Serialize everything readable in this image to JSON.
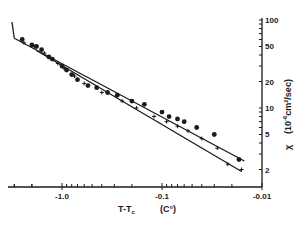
{
  "chart_data": {
    "type": "scatter",
    "title": "",
    "xlabel": "T-T_c   (C°)",
    "ylabel": "χ (10^-6 cm²/sec)",
    "x_scale": "log (negative values, magnitude decreasing to the right)",
    "y_scale": "log",
    "xlim": [
      -3.0,
      -0.01
    ],
    "ylim": [
      1.5,
      100
    ],
    "x_ticks_labeled": [
      "-1.0",
      "-0.1",
      "-0.01"
    ],
    "y_ticks_labeled": [
      "100",
      "50",
      "20",
      "10",
      "5",
      "2"
    ],
    "y_axis_position": "right",
    "grid": false,
    "legend": null,
    "series": [
      {
        "name": "filled circles",
        "marker": "circle",
        "x": [
          -2.5,
          -2.0,
          -1.8,
          -1.6,
          -1.35,
          -1.25,
          -1.0,
          -0.9,
          -0.8,
          -0.7,
          -0.55,
          -0.45,
          -0.35,
          -0.28,
          -0.2,
          -0.15,
          -0.1,
          -0.085,
          -0.07,
          -0.06,
          -0.045,
          -0.03,
          -0.017
        ],
        "y": [
          60,
          52,
          50,
          46,
          38,
          36,
          30,
          27,
          24,
          21,
          18,
          17,
          15,
          14,
          12,
          11,
          9,
          8,
          7.5,
          7,
          6,
          5,
          2.6
        ]
      },
      {
        "name": "crosses",
        "marker": "cross",
        "x": [
          -2.4,
          -1.9,
          -1.5,
          -1.1,
          -0.95,
          -0.75,
          -0.6,
          -0.4,
          -0.25,
          -0.18,
          -0.12,
          -0.09,
          -0.07,
          -0.055,
          -0.04,
          -0.028,
          -0.022,
          -0.016
        ],
        "y": [
          55,
          50,
          42,
          32,
          28,
          23,
          19,
          15,
          12,
          10,
          8,
          7,
          6.2,
          5.5,
          4.5,
          3.5,
          2.3,
          2.0
        ]
      }
    ],
    "fit_lines": [
      {
        "name": "upper fit",
        "x": [
          -3.0,
          -0.015
        ],
        "y": [
          62,
          2.5
        ]
      },
      {
        "name": "lower fit",
        "x": [
          -1.8,
          -0.016
        ],
        "y": [
          45,
          1.9
        ]
      }
    ]
  },
  "axes": {
    "x_title_main": "T-T",
    "x_title_sub": "c",
    "x_title_unit": "(C°)",
    "y_title_symbol": "χ",
    "y_title_unit": "(10",
    "y_title_exp": "-6",
    "y_title_rest": "cm²/sec)"
  }
}
